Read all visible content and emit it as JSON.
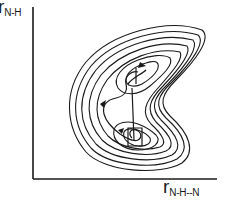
{
  "diagram": {
    "type": "potential-energy-contour-plot",
    "y_axis": {
      "symbol": "r",
      "subscript": "N-H"
    },
    "x_axis": {
      "symbol": "r",
      "subscript": "N-H‑‑N"
    },
    "y_axis_label": "rN-H",
    "x_axis_label": "rN-H--N",
    "contour_count": 7,
    "wells": [
      "upper-well",
      "lower-well"
    ],
    "features": [
      "nested contours",
      "trajectory with arrows",
      "boomerang-shaped surface"
    ],
    "colors": {
      "ink": "#1a1a1a",
      "background": "#ffffff"
    }
  }
}
